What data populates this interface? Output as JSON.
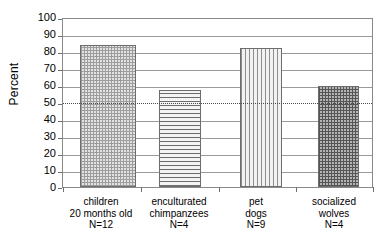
{
  "chart_data": {
    "type": "bar",
    "title": "",
    "xlabel": "",
    "ylabel": "Percent",
    "ylim": [
      0,
      100
    ],
    "ytick_step": 10,
    "grid": true,
    "legend": false,
    "categories": [
      "children 20 months old N=12",
      "enculturated chimpanzees N=4",
      "pet dogs N=9",
      "socialized wolves N=4"
    ],
    "values": [
      84.5,
      58,
      82.5,
      60
    ],
    "reference_line": {
      "value": 50,
      "style": "dotted",
      "label": "50"
    },
    "y_ticks": [
      "0",
      "10",
      "20",
      "30",
      "40",
      "50",
      "60",
      "70",
      "80",
      "90",
      "100"
    ],
    "bars": [
      {
        "label_lines": [
          "children",
          "20 months old",
          "N=12"
        ],
        "value": 84.5,
        "pattern": "grid-light",
        "name": "bar-children"
      },
      {
        "label_lines": [
          "enculturated",
          "chimpanzees",
          "N=4"
        ],
        "value": 58,
        "pattern": "horizontal-lines",
        "name": "bar-enculturated-chimpanzees"
      },
      {
        "label_lines": [
          "pet",
          "dogs",
          "N=9"
        ],
        "value": 82.5,
        "pattern": "vertical-lines",
        "name": "bar-pet-dogs"
      },
      {
        "label_lines": [
          "socialized",
          "wolves",
          "N=4"
        ],
        "value": 60,
        "pattern": "grid-dark",
        "name": "bar-socialized-wolves"
      }
    ],
    "colors": {
      "axis": "#8a8a8a",
      "gridline": "#9a9a9a",
      "reference_line": "#4a4a4a",
      "bar_outline": "#6d6d6d",
      "text": "#000000",
      "background": "#ffffff"
    }
  },
  "axis": {
    "y_title": "Percent",
    "ticks": {
      "t0": "0",
      "t10": "10",
      "t20": "20",
      "t30": "30",
      "t40": "40",
      "t50": "50",
      "t60": "60",
      "t70": "70",
      "t80": "80",
      "t90": "90",
      "t100": "100"
    }
  },
  "labels": {
    "b0l0": "children",
    "b0l1": "20 months old",
    "b0l2": "N=12",
    "b1l0": "enculturated",
    "b1l1": "chimpanzees",
    "b1l2": "N=4",
    "b2l0": "pet",
    "b2l1": "dogs",
    "b2l2": "N=9",
    "b3l0": "socialized",
    "b3l1": "wolves",
    "b3l2": "N=4"
  }
}
